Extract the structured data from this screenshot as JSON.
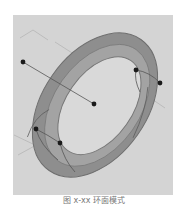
{
  "figure": {
    "caption": "图 x-xx 环面模式",
    "colors": {
      "panel": "#d4d4d4",
      "torus_outer": "#8e8e8e",
      "torus_inner": "#a3a3a3",
      "hole": "#d9d9d9",
      "points": "#1a1a1a",
      "lines": "#555555"
    },
    "points": [
      {
        "x": 23,
        "y": 62
      },
      {
        "x": 94,
        "y": 104
      },
      {
        "x": 136,
        "y": 70
      },
      {
        "x": 160,
        "y": 83
      },
      {
        "x": 36,
        "y": 129
      },
      {
        "x": 60,
        "y": 143
      }
    ]
  }
}
